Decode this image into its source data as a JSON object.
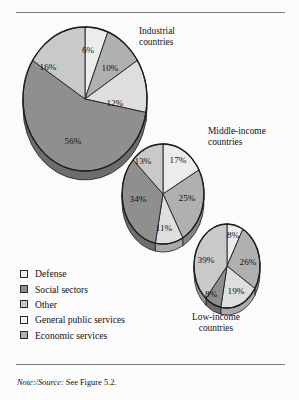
{
  "figure": {
    "background_color": "#fbfbfb",
    "rule_color": "#7e7e7e",
    "note_prefix": "Note:/Source:",
    "note_text": " See Figure 5.2."
  },
  "legend": {
    "items": [
      {
        "label": "Defense",
        "color": "#ececec"
      },
      {
        "label": "Social sectors",
        "color": "#8f8f8f"
      },
      {
        "label": "Other",
        "color": "#c9c9c9"
      },
      {
        "label": "General public services",
        "color": "#f4f4f4"
      },
      {
        "label": "Economic services",
        "color": "#b0b0b0"
      }
    ]
  },
  "captions": {
    "industrial": {
      "line1": "Industrial",
      "line2": "countries"
    },
    "middle": {
      "line1": "Middle-income",
      "line2": "countries"
    },
    "low": {
      "line1": "Low-income",
      "line2": "countries"
    }
  },
  "chart_data": {
    "type": "pie",
    "title": "",
    "subtitle": "",
    "xlabel": "",
    "ylabel": "",
    "grid": false,
    "legend_position": "bottom-left",
    "units": "percent",
    "categories": [
      "Defense",
      "Economic services",
      "General public services",
      "Social sectors",
      "Other"
    ],
    "charts": [
      {
        "name": "Industrial countries",
        "caption_line1": "Industrial",
        "caption_line2": "countries",
        "center": [
          85,
          99
        ],
        "radius_x": 62,
        "radius_y": 72,
        "depth": 9,
        "start_angle": -90,
        "slices": [
          {
            "category": "Defense",
            "value": 6,
            "label": "6%",
            "color": "#ececec",
            "label_pos": [
              88,
              50
            ]
          },
          {
            "category": "Economic services",
            "value": 10,
            "label": "10%",
            "color": "#b0b0b0",
            "label_pos": [
              110,
              68
            ]
          },
          {
            "category": "General public services",
            "value": 12,
            "label": "12%",
            "color": "#dedede",
            "label_pos": [
              115,
              103
            ]
          },
          {
            "category": "Social sectors",
            "value": 56,
            "label": "56%",
            "color": "#8f8f8f",
            "label_pos": [
              73,
              141
            ]
          },
          {
            "category": "Other",
            "value": 16,
            "label": "16%",
            "color": "#c9c9c9",
            "label_pos": [
              48,
              67
            ]
          }
        ]
      },
      {
        "name": "Middle-income countries",
        "caption_line1": "Middle-income",
        "caption_line2": "countries",
        "center": [
          163,
          194
        ],
        "radius_x": 41,
        "radius_y": 50,
        "depth": 8,
        "start_angle": -90,
        "slices": [
          {
            "category": "Defense",
            "value": 17,
            "label": "17%",
            "color": "#ececec",
            "label_pos": [
              178,
              160
            ]
          },
          {
            "category": "Economic services",
            "value": 25,
            "label": "25%",
            "color": "#b0b0b0",
            "label_pos": [
              187,
              198
            ]
          },
          {
            "category": "General public services",
            "value": 11,
            "label": "11%",
            "color": "#dedede",
            "label_pos": [
              164,
              228
            ]
          },
          {
            "category": "Social sectors",
            "value": 34,
            "label": "34%",
            "color": "#8f8f8f",
            "label_pos": [
              138,
              199
            ]
          },
          {
            "category": "Other",
            "value": 13,
            "label": "13%",
            "color": "#c9c9c9",
            "label_pos": [
              143,
              161
            ]
          }
        ]
      },
      {
        "name": "Low-income countries",
        "caption_line1": "Low-income",
        "caption_line2": "countries",
        "center": [
          227,
          266
        ],
        "radius_x": 33,
        "radius_y": 42,
        "depth": 7,
        "start_angle": -90,
        "slices": [
          {
            "category": "Defense",
            "value": 8,
            "label": "8%",
            "color": "#ececec",
            "label_pos": [
              233,
              235
            ]
          },
          {
            "category": "Economic services",
            "value": 26,
            "label": "26%",
            "color": "#b0b0b0",
            "label_pos": [
              248,
              262
            ]
          },
          {
            "category": "General public services",
            "value": 19,
            "label": "19%",
            "color": "#dedede",
            "label_pos": [
              236,
              291
            ]
          },
          {
            "category": "Social sectors",
            "value": 8,
            "label": "8%",
            "color": "#8f8f8f",
            "label_pos": [
              211,
              294
            ]
          },
          {
            "category": "Other",
            "value": 39,
            "label": "39%",
            "color": "#c9c9c9",
            "label_pos": [
              206,
              260
            ]
          }
        ]
      }
    ]
  }
}
